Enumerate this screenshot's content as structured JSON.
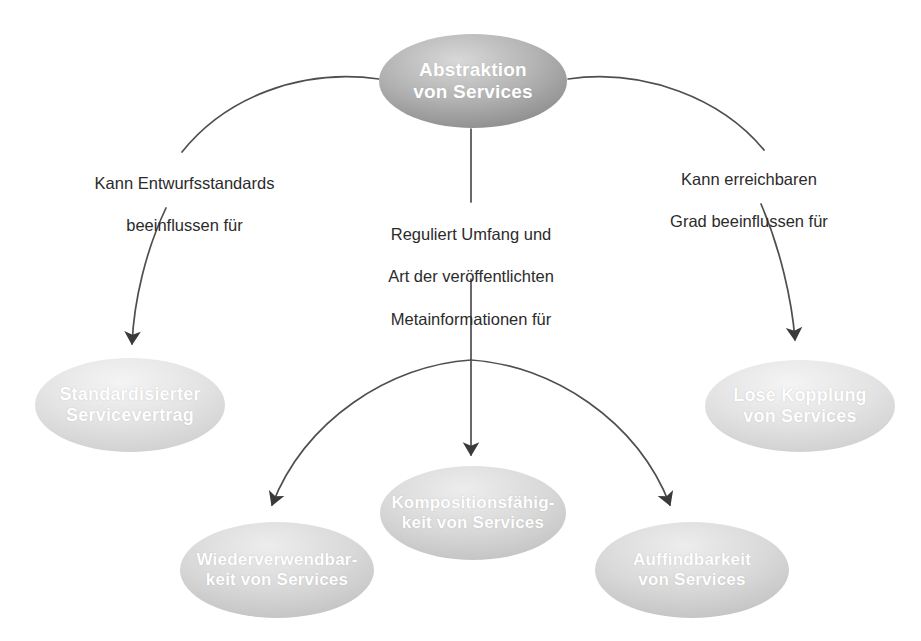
{
  "diagram": {
    "background_color": "#ffffff",
    "node_text_color": "#ffffff",
    "edge_label_color": "#2b2b2b",
    "connector_color": "#4a4a4a",
    "nodes": {
      "abstraktion": {
        "id": "abstraktion",
        "label_line1": "Abstraktion",
        "label_line2": "von Services",
        "fill_top": "#c9c9c9",
        "fill_bottom": "#8f8f8f",
        "cx": 473,
        "cy": 81,
        "rx": 94,
        "ry": 47,
        "font_size": 19
      },
      "standardisierter-servicevertrag": {
        "id": "standardisierter-servicevertrag",
        "label_line1": "Standardisierter",
        "label_line2": "Servicevertrag",
        "fill_top": "#efefef",
        "fill_bottom": "#d3d3d3",
        "cx": 130,
        "cy": 405,
        "rx": 95,
        "ry": 47,
        "font_size": 18
      },
      "lose-kopplung": {
        "id": "lose-kopplung",
        "label_line1": "Lose Kopplung",
        "label_line2": "von Services",
        "fill_top": "#efefef",
        "fill_bottom": "#d3d3d3",
        "cx": 800,
        "cy": 406,
        "rx": 95,
        "ry": 46,
        "font_size": 18
      },
      "wiederverwendbarkeit": {
        "id": "wiederverwendbarkeit",
        "label_line1": "Wiederverwendbar-",
        "label_line2": "keit von Services",
        "fill_top": "#e4e4e4",
        "fill_bottom": "#c6c6c6",
        "cx": 277,
        "cy": 570,
        "rx": 97,
        "ry": 48,
        "font_size": 17
      },
      "kompositionsfaehigkeit": {
        "id": "kompositionsfaehigkeit",
        "label_line1": "Kompositionsfähig-",
        "label_line2": "keit von Services",
        "fill_top": "#e7e7e7",
        "fill_bottom": "#cacaca",
        "cx": 473,
        "cy": 513,
        "rx": 93,
        "ry": 47,
        "font_size": 17
      },
      "auffindbarkeit": {
        "id": "auffindbarkeit",
        "label_line1": "Auffindbarkeit",
        "label_line2": "von Services",
        "fill_top": "#e4e4e4",
        "fill_bottom": "#c6c6c6",
        "cx": 692,
        "cy": 570,
        "rx": 97,
        "ry": 48,
        "font_size": 17
      }
    },
    "edges": [
      {
        "id": "edge-left",
        "from": "abstraktion",
        "to": "standardisierter-servicevertrag",
        "label_line1": "Kann Entwurfsstandards",
        "label_line2": "beeinflussen für"
      },
      {
        "id": "edge-center",
        "from": "abstraktion",
        "to": "kompositionsfaehigkeit",
        "label_line1": "Reguliert Umfang und",
        "label_line2": "Art der veröffentlichten",
        "label_line3": "Metainformationen für"
      },
      {
        "id": "edge-right",
        "from": "abstraktion",
        "to": "lose-kopplung",
        "label_line1": "Kann erreichbaren",
        "label_line2": "Grad beeinflussen für"
      },
      {
        "id": "edge-center-left-branch",
        "from": "abstraktion",
        "to": "wiederverwendbarkeit",
        "label_line1": "",
        "label_line2": ""
      },
      {
        "id": "edge-center-right-branch",
        "from": "abstraktion",
        "to": "auffindbarkeit",
        "label_line1": "",
        "label_line2": ""
      }
    ],
    "edge_labels": {
      "left": {
        "line1": "Kann Entwurfsstandards",
        "line2": "beeinflussen für"
      },
      "center": {
        "line1": "Reguliert Umfang und",
        "line2": "Art der veröffentlichten",
        "line3": "Metainformationen für"
      },
      "right": {
        "line1": "Kann erreichbaren",
        "line2": "Grad beeinflussen für"
      }
    }
  }
}
